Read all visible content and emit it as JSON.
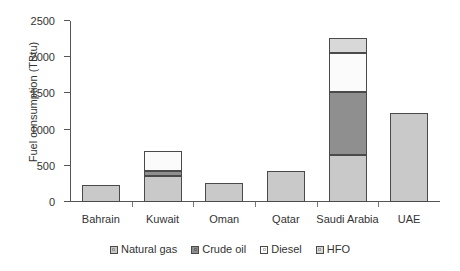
{
  "chart_data": {
    "type": "bar",
    "subtype": "stacked",
    "title": "",
    "xlabel": "",
    "ylabel": "Fuel consumption (TBtu)",
    "ylim": [
      0,
      2500
    ],
    "yticks": [
      0,
      500,
      1000,
      1500,
      2000,
      2500
    ],
    "grid": false,
    "legend_position": "bottom",
    "categories": [
      "Bahrain",
      "Kuwait",
      "Oman",
      "Qatar",
      "Saudi Arabia",
      "UAE"
    ],
    "series": [
      {
        "name": "Natural gas",
        "color": "#c9c9c9",
        "values": [
          240,
          360,
          260,
          430,
          650,
          1225
        ]
      },
      {
        "name": "Crude oil",
        "color": "#8f8f8f",
        "values": [
          0,
          70,
          0,
          0,
          870,
          0
        ]
      },
      {
        "name": "Diesel",
        "color": "#fbfbfb",
        "values": [
          0,
          270,
          0,
          0,
          540,
          0
        ]
      },
      {
        "name": "HFO",
        "color": "#d8d8d8",
        "values": [
          0,
          0,
          0,
          0,
          210,
          0
        ]
      }
    ],
    "totals": [
      240,
      700,
      260,
      430,
      2270,
      1225
    ]
  },
  "colors": {
    "axis": "#555555",
    "bar_outline": "#4a4a4a",
    "text": "#333333",
    "background": "#ffffff"
  }
}
